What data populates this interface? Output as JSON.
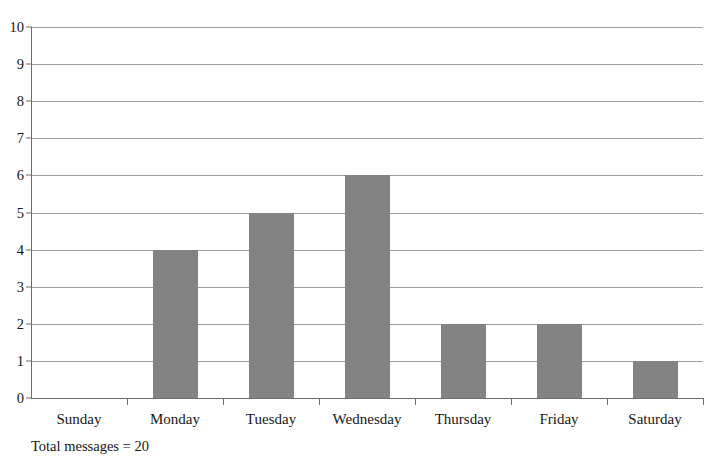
{
  "chart_data": {
    "type": "bar",
    "title": "",
    "subtitle": "",
    "xlabel": "",
    "ylabel": "",
    "categories": [
      "Sunday",
      "Monday",
      "Tuesday",
      "Wednesday",
      "Thursday",
      "Friday",
      "Saturday"
    ],
    "values": [
      0,
      4,
      5,
      6,
      2,
      2,
      1
    ],
    "series": [
      {
        "name": "Messages",
        "values": [
          0,
          4,
          5,
          6,
          2,
          2,
          1
        ]
      }
    ],
    "ylim": [
      0,
      10
    ],
    "ytick_values": [
      0,
      1,
      2,
      3,
      4,
      5,
      6,
      7,
      8,
      9,
      10
    ],
    "ytick_labels": [
      "0",
      "1",
      "2",
      "3",
      "4",
      "5",
      "6",
      "7",
      "8",
      "9",
      "10"
    ],
    "ytick_step": 1,
    "grid": true,
    "grid_axis": "y",
    "legend": false,
    "legend_position": "none",
    "annotations": [
      {
        "name": "total-messages-caption",
        "text": "Total messages = 20"
      }
    ],
    "colors": {
      "bar_fill": "#838383",
      "gridline": "#9d9d9d",
      "axis_line": "#6e6e6e",
      "background": "#ffffff",
      "text": "#171717"
    }
  },
  "caption": {
    "total_messages_text": "Total messages = 20"
  }
}
